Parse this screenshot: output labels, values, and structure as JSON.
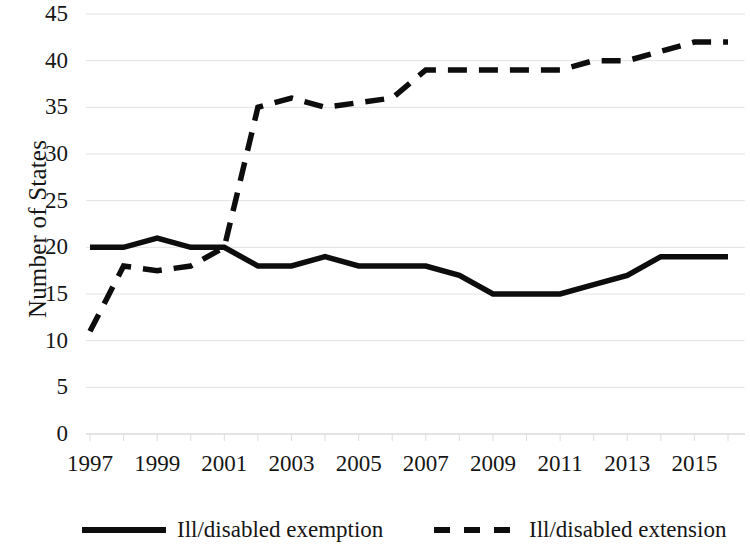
{
  "chart_data": {
    "type": "line",
    "title": "",
    "subtitle": "",
    "xlabel": "",
    "ylabel": "Number of States",
    "x": [
      1997,
      1998,
      1999,
      2000,
      2001,
      2002,
      2003,
      2004,
      2005,
      2006,
      2007,
      2008,
      2009,
      2010,
      2011,
      2012,
      2013,
      2014,
      2015,
      2016
    ],
    "xlim": [
      1997,
      2016
    ],
    "ylim": [
      0,
      45
    ],
    "xtick_labels": [
      "1997",
      "1999",
      "2001",
      "2003",
      "2005",
      "2007",
      "2009",
      "2011",
      "2013",
      "2015"
    ],
    "xtick_values": [
      1997,
      1999,
      2001,
      2003,
      2005,
      2007,
      2009,
      2011,
      2013,
      2015
    ],
    "ytick_labels": [
      "0",
      "5",
      "10",
      "15",
      "20",
      "25",
      "30",
      "35",
      "40",
      "45"
    ],
    "ytick_values": [
      0,
      5,
      10,
      15,
      20,
      25,
      30,
      35,
      40,
      45
    ],
    "grid": true,
    "grid_axis": "y",
    "legend_position": "bottom",
    "series": [
      {
        "name": "Ill/disabled exemption",
        "style": "solid",
        "color": "#0d0d0d",
        "values": [
          20,
          20,
          21,
          20,
          20,
          18,
          18,
          19,
          18,
          18,
          18,
          17,
          15,
          15,
          15,
          16,
          17,
          19,
          19,
          19
        ]
      },
      {
        "name": "Ill/disabled extension",
        "style": "dashed",
        "color": "#0d0d0d",
        "values": [
          11,
          18,
          17.5,
          18,
          20,
          35,
          36,
          35,
          35.5,
          36,
          39,
          39,
          39,
          39,
          39,
          40,
          40,
          41,
          42,
          42
        ]
      }
    ]
  },
  "axes": {
    "y_title": "Number of States"
  },
  "legend": {
    "items": [
      {
        "label": "Ill/disabled exemption",
        "style": "solid"
      },
      {
        "label": "Ill/disabled extension",
        "style": "dashed"
      }
    ]
  }
}
